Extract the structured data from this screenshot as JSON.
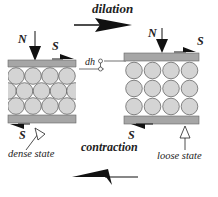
{
  "diagram": {
    "top_label": "dilation",
    "bottom_label": "contraction",
    "left_panel": {
      "state_label": "dense state",
      "normal_force": "N",
      "shear_top": "S",
      "shear_bottom": "S",
      "packing": "hexagonal (dense)",
      "rows": 3,
      "circles_per_row": [
        4,
        4,
        4
      ]
    },
    "right_panel": {
      "state_label": "loose state",
      "normal_force": "N",
      "shear_top": "S",
      "shear_bottom": "S",
      "packing": "square (loose)",
      "rows": 3,
      "circles_per_row": [
        4,
        4,
        4
      ]
    },
    "height_change_label": "dh",
    "colors": {
      "plate": "#a6a6a6",
      "circle_fill": "#d4d4d4",
      "circle_stroke": "#555555",
      "arrow": "#111111"
    }
  }
}
